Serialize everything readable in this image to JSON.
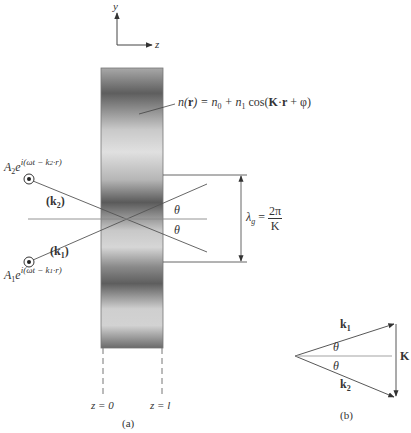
{
  "axes": {
    "y_label": "y",
    "z_label": "z"
  },
  "grating": {
    "index_formula": "n(r) = n0 + n1 cos(K·r + φ)",
    "index_parts": {
      "lhs": "n(",
      "r": "r",
      "eq": ") = n",
      "n0_sub": "0",
      "plus": " + n",
      "n1_sub": "1",
      "cos": " cos(",
      "K": "K",
      "dot": "·",
      "r2": "r",
      "tail": " + φ)"
    },
    "boundary_left": "z = 0",
    "boundary_right": "z = l",
    "colors": {
      "dark_band": "#5a5a5a",
      "light_band": "#d8d8d8"
    }
  },
  "beams": {
    "beam2": {
      "amp": "A",
      "amp_sub": "2",
      "exp_base": "e",
      "exponent": "i(ωt − k",
      "k_sub": "2",
      "exponent_tail": "·r)",
      "wave_label": "(k",
      "wave_sub": "2",
      "wave_close": ")"
    },
    "beam1": {
      "amp": "A",
      "amp_sub": "1",
      "exp_base": "e",
      "exponent": "i(ωt − k",
      "k_sub": "1",
      "exponent_tail": "·r)",
      "wave_label": "(k",
      "wave_sub": "1",
      "wave_close": ")"
    }
  },
  "angles": {
    "upper": "θ",
    "lower": "θ"
  },
  "period": {
    "symbol": "λ",
    "sub": "g",
    "eq": "=",
    "numerator": "2π",
    "denominator": "K"
  },
  "vector_diagram": {
    "k1": "k",
    "k1_sub": "1",
    "k2": "k",
    "k2_sub": "2",
    "K": "K",
    "theta_upper": "θ",
    "theta_lower": "θ"
  },
  "captions": {
    "a": "(a)",
    "b": "(b)"
  }
}
